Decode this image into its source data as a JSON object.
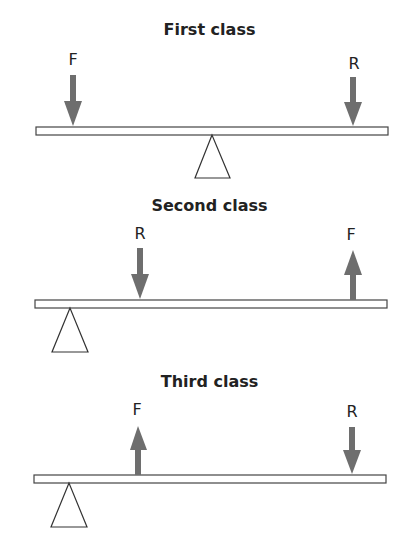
{
  "diagram": {
    "arrow_color": "#6e6e6e",
    "panels": [
      {
        "title": "First class",
        "forces": [
          {
            "label": "F",
            "direction": "down",
            "x": 73
          },
          {
            "label": "R",
            "direction": "down",
            "x": 353
          }
        ],
        "fulcrum_x": 212
      },
      {
        "title": "Second class",
        "forces": [
          {
            "label": "R",
            "direction": "down",
            "x": 140
          },
          {
            "label": "F",
            "direction": "up",
            "x": 352
          }
        ],
        "fulcrum_x": 70
      },
      {
        "title": "Third class",
        "forces": [
          {
            "label": "F",
            "direction": "up",
            "x": 137
          },
          {
            "label": "R",
            "direction": "down",
            "x": 352
          }
        ],
        "fulcrum_x": 69
      }
    ]
  }
}
